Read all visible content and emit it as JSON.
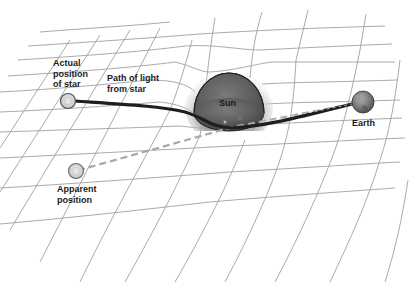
{
  "labels": {
    "actual_position": "Actual\nposition\nof star",
    "path_of_light": "Path of light\nfrom star",
    "sun": "Sun",
    "earth": "Earth",
    "apparent_position": "Apparent\nposition"
  },
  "objects": {
    "actual_star": {
      "name": "Actual position of star",
      "x": 68,
      "y": 101,
      "r": 7
    },
    "apparent_star": {
      "name": "Apparent position",
      "x": 76,
      "y": 171,
      "r": 7
    },
    "sun": {
      "name": "Sun",
      "x": 229,
      "y": 103,
      "r": 35
    },
    "earth": {
      "name": "Earth",
      "x": 363,
      "y": 102,
      "r": 11
    }
  },
  "paths": {
    "light_path": "solid curved line from actual star, bending around the Sun, to Earth",
    "apparent_line": "dashed straight line from Earth back to apparent position"
  },
  "colors": {
    "grid": "#9a9a9a",
    "light_path": "#1e1e1e",
    "dashed_line": "#a8a8a8",
    "sun_fill": "#5e5e5e",
    "sun_glow": "#bdbdbd",
    "star_fill": "#d6d6d6",
    "earth_fill": "#7a7a7a",
    "text": "#1a1a1a"
  }
}
